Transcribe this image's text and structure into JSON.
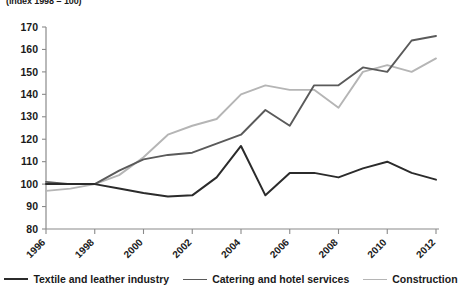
{
  "chart_data": {
    "type": "line",
    "title": "",
    "subtitle": "(index 1998 = 100)",
    "xlabel": "",
    "ylabel": "",
    "x": [
      1996,
      1997,
      1998,
      1999,
      2000,
      2001,
      2002,
      2003,
      2004,
      2005,
      2006,
      2007,
      2008,
      2009,
      2010,
      2011,
      2012
    ],
    "xlim": [
      1996,
      2012
    ],
    "ylim": [
      80,
      170
    ],
    "xticks": [
      1996,
      1998,
      2000,
      2002,
      2004,
      2006,
      2008,
      2010,
      2012
    ],
    "xtick_labels": [
      "1996",
      "1998",
      "2000",
      "2002",
      "2004",
      "2006",
      "2008",
      "2010",
      "2012"
    ],
    "yticks": [
      80,
      90,
      100,
      110,
      120,
      130,
      140,
      150,
      160,
      170
    ],
    "ytick_labels": [
      "80",
      "90",
      "100",
      "110",
      "120",
      "130",
      "140",
      "150",
      "160",
      "170"
    ],
    "grid": false,
    "legend_position": "bottom",
    "series": [
      {
        "name": "Textile and leather industry",
        "color": "#2b2b2b",
        "width": 2.0,
        "values": [
          100,
          100,
          100,
          98,
          96,
          94.5,
          95,
          103,
          117,
          95,
          105,
          105,
          103,
          107,
          110,
          105,
          102
        ]
      },
      {
        "name": "Catering and hotel services",
        "color": "#5a5a5a",
        "width": 1.9,
        "values": [
          101,
          100,
          100,
          106,
          111,
          113,
          114,
          118,
          122,
          133,
          126,
          144,
          144,
          152,
          150,
          164,
          166
        ]
      },
      {
        "name": "Construction",
        "color": "#b5b5b5",
        "width": 1.9,
        "values": [
          97,
          98,
          100,
          104,
          112,
          122,
          126,
          129,
          140,
          144,
          142,
          142,
          134,
          150,
          153,
          150,
          156
        ]
      }
    ]
  },
  "legend": {
    "items": [
      {
        "label": "Textile and leather industry",
        "color": "#2b2b2b"
      },
      {
        "label": "Catering and hotel services",
        "color": "#5a5a5a"
      },
      {
        "label": "Construction",
        "color": "#b5b5b5"
      }
    ]
  }
}
